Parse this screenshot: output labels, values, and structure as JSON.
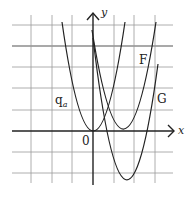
{
  "diagram": {
    "type": "coordinate-plot",
    "axes": {
      "x_label": "x",
      "y_label": "y",
      "origin_label": "0"
    },
    "grid": {
      "unit_px": 21,
      "x_range": [
        -4,
        3
      ],
      "y_range": [
        -2,
        5
      ],
      "bold_line_y": 4
    },
    "curves": [
      {
        "name": "q_a",
        "label": "q",
        "label_sub": "a",
        "vertex": [
          0,
          0
        ],
        "opens": "up"
      },
      {
        "name": "F",
        "label": "F",
        "vertex": [
          1.5,
          0
        ],
        "opens": "up"
      },
      {
        "name": "G",
        "label": "G",
        "vertex": [
          1.5,
          -2
        ],
        "opens": "up"
      }
    ]
  }
}
